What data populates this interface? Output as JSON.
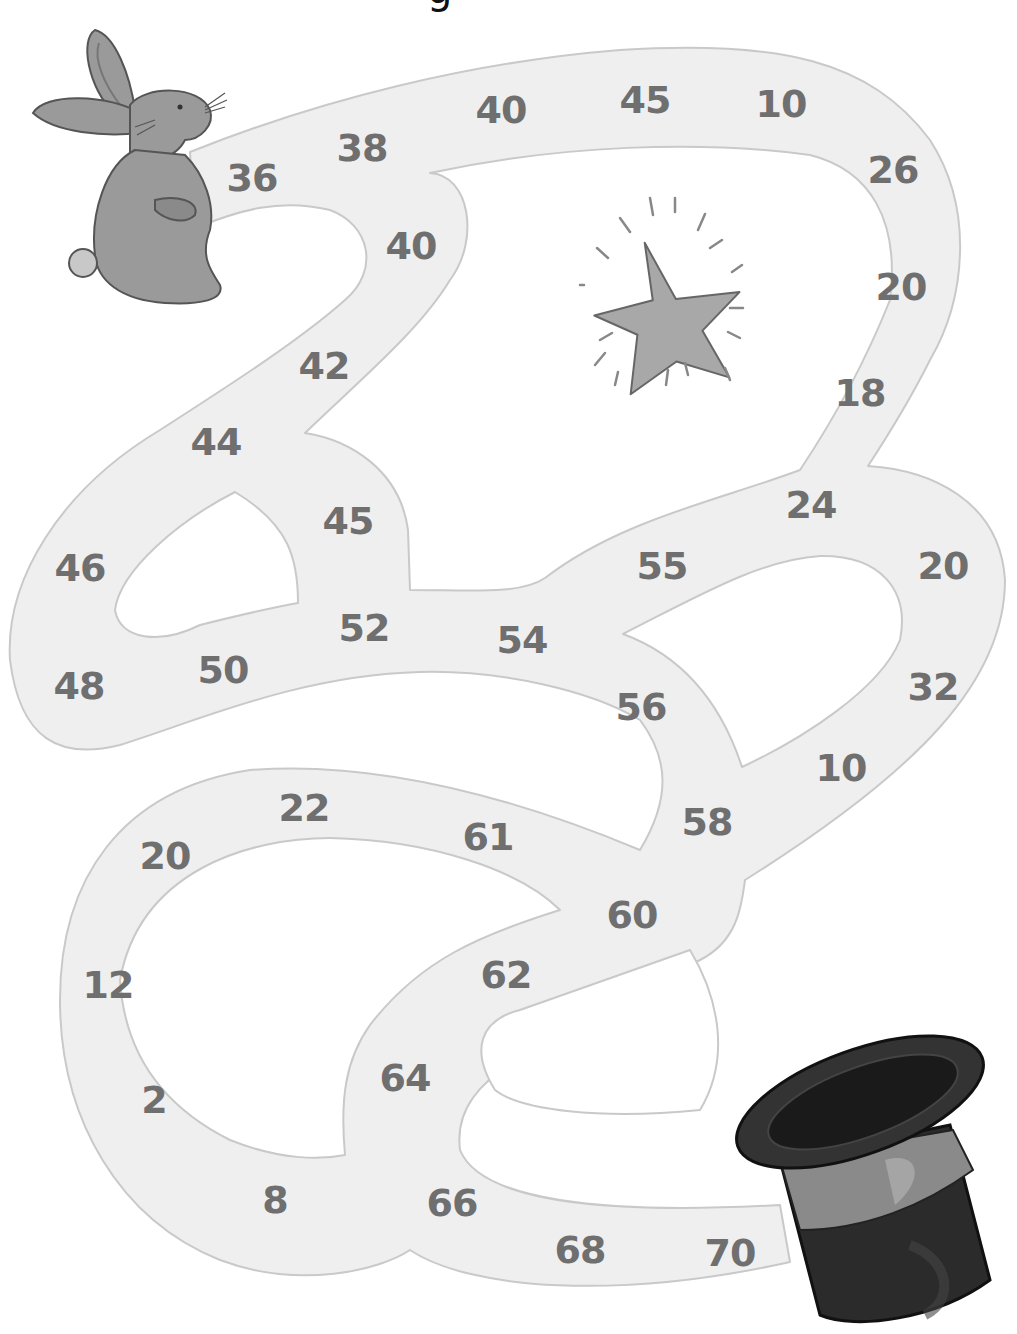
{
  "page": {
    "heading_fragment": "g",
    "colors": {
      "path_fill": "#efefef",
      "path_stroke": "#c9c9c9",
      "number_text": "#6f6f6f",
      "rabbit_body": "#9a9a9a",
      "rabbit_outline": "#555555",
      "star_fill": "#a8a8a8",
      "hat_body": "#2b2b2b",
      "hat_band": "#8a8a8a"
    }
  },
  "maze": {
    "start_image": "rabbit",
    "end_image": "top-hat",
    "decoration": "sparkling-star",
    "cells": [
      {
        "value": "36",
        "x": 252,
        "y": 178
      },
      {
        "value": "38",
        "x": 362,
        "y": 148
      },
      {
        "value": "40",
        "x": 501,
        "y": 110
      },
      {
        "value": "45",
        "x": 645,
        "y": 100
      },
      {
        "value": "10",
        "x": 781,
        "y": 104
      },
      {
        "value": "26",
        "x": 893,
        "y": 170
      },
      {
        "value": "20",
        "x": 901,
        "y": 287
      },
      {
        "value": "18",
        "x": 860,
        "y": 393
      },
      {
        "value": "24",
        "x": 811,
        "y": 505
      },
      {
        "value": "20",
        "x": 943,
        "y": 566
      },
      {
        "value": "32",
        "x": 933,
        "y": 687
      },
      {
        "value": "10",
        "x": 841,
        "y": 768
      },
      {
        "value": "58",
        "x": 707,
        "y": 822
      },
      {
        "value": "40",
        "x": 411,
        "y": 246
      },
      {
        "value": "42",
        "x": 324,
        "y": 366
      },
      {
        "value": "44",
        "x": 216,
        "y": 442
      },
      {
        "value": "45",
        "x": 348,
        "y": 521
      },
      {
        "value": "46",
        "x": 80,
        "y": 568
      },
      {
        "value": "48",
        "x": 79,
        "y": 686
      },
      {
        "value": "50",
        "x": 223,
        "y": 670
      },
      {
        "value": "52",
        "x": 364,
        "y": 628
      },
      {
        "value": "54",
        "x": 522,
        "y": 640
      },
      {
        "value": "55",
        "x": 662,
        "y": 566
      },
      {
        "value": "56",
        "x": 641,
        "y": 707
      },
      {
        "value": "60",
        "x": 632,
        "y": 915
      },
      {
        "value": "61",
        "x": 488,
        "y": 837
      },
      {
        "value": "22",
        "x": 304,
        "y": 808
      },
      {
        "value": "20",
        "x": 165,
        "y": 856
      },
      {
        "value": "12",
        "x": 108,
        "y": 985
      },
      {
        "value": "2",
        "x": 154,
        "y": 1100
      },
      {
        "value": "8",
        "x": 275,
        "y": 1200
      },
      {
        "value": "62",
        "x": 506,
        "y": 975
      },
      {
        "value": "64",
        "x": 405,
        "y": 1078
      },
      {
        "value": "66",
        "x": 452,
        "y": 1203
      },
      {
        "value": "68",
        "x": 580,
        "y": 1250
      },
      {
        "value": "70",
        "x": 730,
        "y": 1253
      }
    ]
  }
}
